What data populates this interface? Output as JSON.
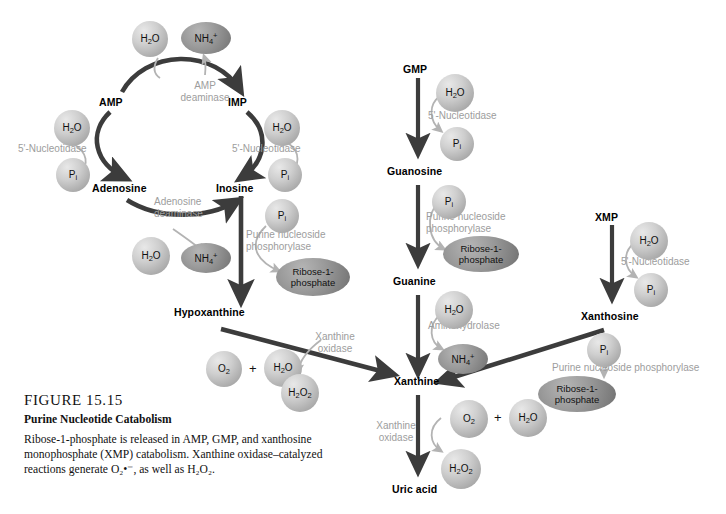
{
  "figure": {
    "number": "FIGURE 15.15",
    "title": "Purine Nucleotide Catabolism",
    "body": "Ribose-1-phosphate is released in AMP, GMP, and xanthosine monophosphate (XMP) catabolism. Xanthine oxidase–catalyzed reactions generate O₂•⁻, as well as H₂O₂."
  },
  "metabolites": {
    "amp": "AMP",
    "imp": "IMP",
    "adenosine": "Adenosine",
    "inosine": "Inosine",
    "hypoxanthine": "Hypoxanthine",
    "gmp": "GMP",
    "guanosine": "Guanosine",
    "guanine": "Guanine",
    "xmp": "XMP",
    "xanthosine": "Xanthosine",
    "xanthine": "Xanthine",
    "uric_acid": "Uric acid"
  },
  "enzymes": {
    "amp_deaminase": "AMP\ndeaminase",
    "amp_deaminase_l1": "AMP",
    "amp_deaminase_l2": "deaminase",
    "nucleotidase_amp": "5'-Nucleotidase",
    "nucleotidase_imp": "5'-Nucleotidase",
    "nucleotidase_gmp": "5'-Nucleotidase",
    "nucleotidase_xmp": "5'-Nucleotidase",
    "adenosine_deaminase_l1": "Adenosine",
    "adenosine_deaminase_l2": "deaminase",
    "pnp_inosine_l1": "Purine nucleoside",
    "pnp_inosine_l2": "phosphorylase",
    "pnp_guanosine_l1": "Purine nucleoside",
    "pnp_guanosine_l2": "phosphorylase",
    "pnp_xanthosine": "Purine nucleoside phosphorylase",
    "aminohydrolase": "Aminohydrolase",
    "xanthine_oxidase_hypo_l1": "Xanthine",
    "xanthine_oxidase_hypo_l2": "oxidase",
    "xanthine_oxidase_uric_l1": "Xanthine",
    "xanthine_oxidase_uric_l2": "oxidase"
  },
  "molecules": {
    "water": "H2O",
    "ammonium": "NH4+",
    "phosphate": "Pi",
    "ribose1p_l1": "Ribose-1-",
    "ribose1p_l2": "phosphate",
    "oxygen": "O2",
    "peroxide": "H2O2",
    "plus": "+"
  },
  "colors": {
    "arrow_dark": "#3c3c3c",
    "arrow_light": "#b3b3b3",
    "enzyme_text": "#9d9d9d",
    "sphere_light": "#cfcfcf",
    "ellipse_dark": "#8f8f8f",
    "background": "#ffffff",
    "text": "#000000"
  }
}
